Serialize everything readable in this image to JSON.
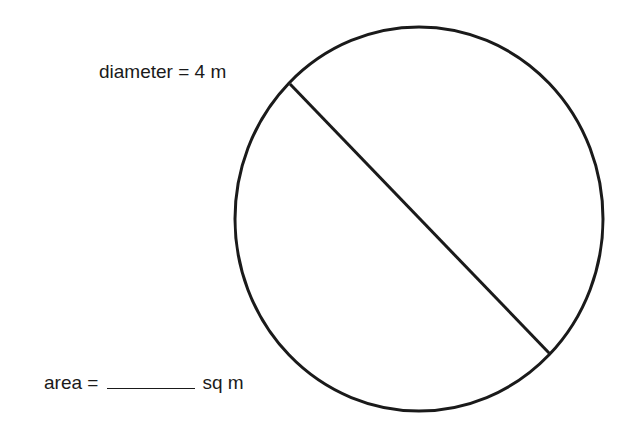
{
  "figure": {
    "shape": "circle",
    "diameter_label": "diameter = 4 m",
    "area_label": {
      "prefix": "area =",
      "blank": "",
      "unit": "sq m"
    },
    "colors": {
      "stroke": "#1a1a1a",
      "background": "#ffffff"
    }
  }
}
